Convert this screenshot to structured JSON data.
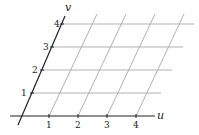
{
  "diagram": {
    "title": "",
    "axes": {
      "u": {
        "label": "u",
        "ticks": [
          "1",
          "2",
          "3",
          "4"
        ]
      },
      "v": {
        "label": "v",
        "ticks": [
          "1",
          "2",
          "3",
          "4"
        ]
      }
    },
    "colors": {
      "axis": "#222222",
      "grid": "#a8a8a8"
    }
  }
}
